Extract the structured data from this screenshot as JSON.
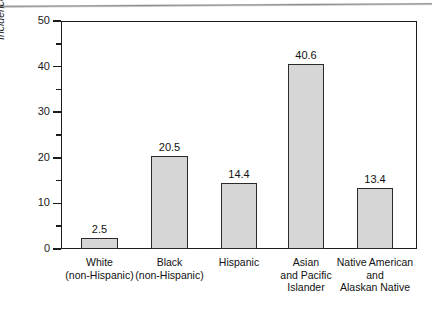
{
  "figure": {
    "axis_title_y": "Incidence (per 100,000 person-years)",
    "colors": {
      "bar_fill": "#d6d6d6",
      "bar_stroke": "#2a2a2a",
      "axis": "#1c1c1c",
      "text": "#111111",
      "background": "#ffffff"
    }
  },
  "chart_data": {
    "type": "bar",
    "title": "",
    "xlabel": "",
    "ylabel": "Incidence (per 100,000 person-years)",
    "ylim": [
      0,
      50
    ],
    "grid": false,
    "legend": "none",
    "y_major_ticks": [
      "0",
      "10",
      "20",
      "30",
      "40",
      "50"
    ],
    "y_minor_ticks": [
      5,
      15,
      25,
      35,
      45
    ],
    "categories": [
      "White (non-Hispanic)",
      "Black (non-Hispanic)",
      "Hispanic",
      "Asian and Pacific Islander",
      "Native American and Alaskan Native"
    ],
    "category_lines": [
      [
        "White",
        "(non-Hispanic)"
      ],
      [
        "Black",
        "(non-Hispanic)"
      ],
      [
        "Hispanic"
      ],
      [
        "Asian",
        "and Pacific",
        "Islander"
      ],
      [
        "Native American",
        "and",
        "Alaskan Native"
      ]
    ],
    "values": [
      2.5,
      20.5,
      14.4,
      40.6,
      13.4
    ],
    "value_labels": [
      "2.5",
      "20.5",
      "14.4",
      "40.6",
      "13.4"
    ]
  }
}
